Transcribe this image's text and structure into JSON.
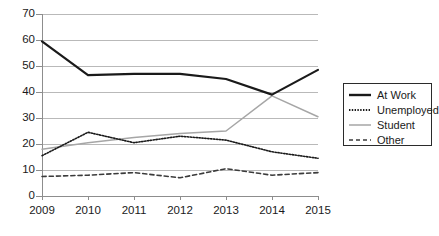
{
  "chart_data": {
    "type": "line",
    "title": "",
    "subtitle": "",
    "xlabel": "",
    "ylabel": "",
    "categories": [
      "2009",
      "2010",
      "2011",
      "2012",
      "2013",
      "2014",
      "2015"
    ],
    "x_tick_labels": [
      "2009",
      "2010",
      "2011",
      "2012",
      "2013",
      "2014",
      "2015"
    ],
    "y_tick_labels": [
      "0",
      "10",
      "20",
      "30",
      "40",
      "50",
      "60",
      "70"
    ],
    "y_ticks": [
      0,
      10,
      20,
      30,
      40,
      50,
      60,
      70
    ],
    "ylim": [
      0,
      70
    ],
    "grid": "horizontal",
    "legend_position": "right",
    "series": [
      {
        "name": "At Work",
        "values": [
          59.5,
          46.5,
          47,
          47,
          45,
          39,
          48.5
        ],
        "color": "#1a1a1a",
        "style": "solid",
        "width": 2.2
      },
      {
        "name": "Unemployed",
        "values": [
          15.5,
          24.5,
          20.5,
          23,
          21.5,
          17,
          14.5
        ],
        "color": "#1a1a1a",
        "style": "dotted",
        "width": 1.6
      },
      {
        "name": "Student",
        "values": [
          18,
          20.5,
          22.5,
          24,
          25,
          38.5,
          30.5
        ],
        "color": "#a6a6a6",
        "style": "solid",
        "width": 1.5
      },
      {
        "name": "Other",
        "values": [
          7.5,
          8,
          9,
          7,
          10.5,
          8,
          9
        ],
        "color": "#3b3b3b",
        "style": "dashed",
        "width": 1.6
      }
    ]
  },
  "legend": {
    "items": [
      {
        "label": "At Work"
      },
      {
        "label": "Unemployed"
      },
      {
        "label": "Student"
      },
      {
        "label": "Other"
      }
    ]
  },
  "axes": {
    "y_labels": [
      "70",
      "60",
      "50",
      "40",
      "30",
      "20",
      "10",
      "0"
    ],
    "x_labels": [
      "2009",
      "2010",
      "2011",
      "2012",
      "2013",
      "2014",
      "2015"
    ]
  },
  "colors": {
    "gridline": "#b9b9b9",
    "axis": "#8d8d8d",
    "text": "#1a1a1a",
    "at_work": "#1a1a1a",
    "unemployed": "#1a1a1a",
    "student": "#a6a6a6",
    "other": "#3b3b3b",
    "background": "#ffffff"
  }
}
